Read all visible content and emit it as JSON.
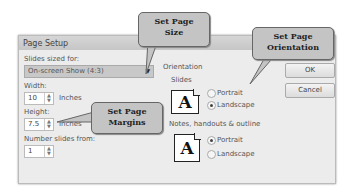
{
  "dialog": {
    "title": "Page Setup",
    "slides_sized_for_label": "Slides sized for:",
    "slides_sized_for_value": "On-screen Show (4:3)",
    "width_label": "Width:",
    "width_value": "10",
    "width_unit": "Inches",
    "height_label": "Height:",
    "height_value": "7.5",
    "height_unit": "Inches",
    "number_slides_label": "Number slides from:",
    "number_slides_value": "1",
    "orientation_label": "Orientation",
    "slides_label": "Slides",
    "slides_portrait": "Portrait",
    "slides_landscape": "Landscape",
    "slides_selected": "Landscape",
    "notes_label": "Notes, handouts & outline",
    "notes_portrait": "Portrait",
    "notes_landscape": "Landscape",
    "notes_selected": "Portrait",
    "ok_label": "OK",
    "cancel_label": "Cancel",
    "page_icon_glyph": "A"
  },
  "callouts": {
    "size": "Set Page Size",
    "size_line1": "Set Page",
    "size_line2": "Size",
    "orientation_line1": "Set Page",
    "orientation_line2": "Orientation",
    "margins_line1": "Set Page",
    "margins_line2": "Margins"
  },
  "spinner_up": "▲",
  "spinner_down": "▼",
  "dropdown_arrow": "▼"
}
